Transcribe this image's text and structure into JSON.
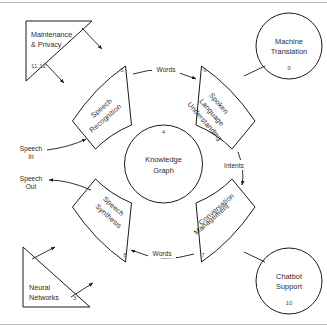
{
  "diagram": {
    "center": {
      "label_line1": "Knowledge",
      "label_line2": "Graph",
      "number": "4",
      "name": "knowledge-graph"
    },
    "wedges": [
      {
        "name": "speech-recognition",
        "label_line1": "Speech",
        "label_line2": "Recognition",
        "number": "5"
      },
      {
        "name": "spoken-language-understanding",
        "label_line1": "Spoken",
        "label_line2": "Language",
        "label_line3": "Understanding",
        "number": "6"
      },
      {
        "name": "conversation-management",
        "label_line1": "Conversation",
        "label_line2": "Management",
        "number": "7"
      },
      {
        "name": "speech-synthesis",
        "label_line1": "Speech",
        "label_line2": "Synthesis",
        "number": "8"
      }
    ],
    "circles": [
      {
        "name": "machine-translation",
        "label_line1": "Machine",
        "label_line2": "Translation",
        "number": "9"
      },
      {
        "name": "chatbot-support",
        "label_line1": "Chatbot",
        "label_line2": "Support",
        "number": "10"
      }
    ],
    "triangles": [
      {
        "name": "maintenance-privacy",
        "label_line1": "Maintenance",
        "label_line2": "& Privacy",
        "number": "11,12"
      },
      {
        "name": "neural-networks",
        "label_line1": "Neural",
        "label_line2": "Networks",
        "number": "3"
      }
    ],
    "edges": [
      {
        "name": "edge-words-top",
        "label": "Words"
      },
      {
        "name": "edge-intents",
        "label": "Intents"
      },
      {
        "name": "edge-words-bottom",
        "label": "Words"
      }
    ],
    "io": [
      {
        "name": "speech-in",
        "label_line1": "Speech",
        "label_line2": "In"
      },
      {
        "name": "speech-out",
        "label_line1": "Speech",
        "label_line2": "Out"
      }
    ],
    "colors": {
      "stroke": "#1a1a1a",
      "text": "#2b2b2b",
      "background": "#ffffff",
      "frame": "#b9b9b9"
    }
  }
}
